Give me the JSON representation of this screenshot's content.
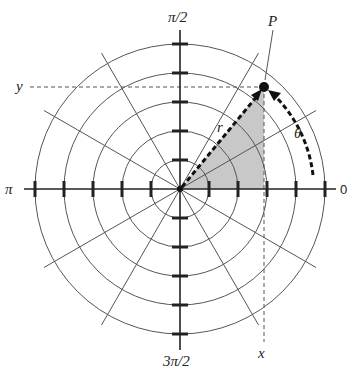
{
  "diagram": {
    "type": "polar-coordinate-grid",
    "colors": {
      "line": "#333333",
      "grid": "#555555",
      "shade": "#c8c8c8",
      "background": "#ffffff"
    },
    "axis_labels": {
      "right": "0",
      "top": "π/2",
      "left": "π",
      "bottom": "3π/2"
    },
    "point_label": "P",
    "radius_label": "r",
    "angle_label": "θ",
    "x_label": "x",
    "y_label": "y",
    "grid": {
      "rings": 5,
      "spoke_angles_deg": [
        30,
        60,
        120,
        150,
        210,
        240,
        300,
        330
      ]
    },
    "point": {
      "angle_deg": 50.5,
      "radius_ring_fraction": 0.91
    }
  }
}
